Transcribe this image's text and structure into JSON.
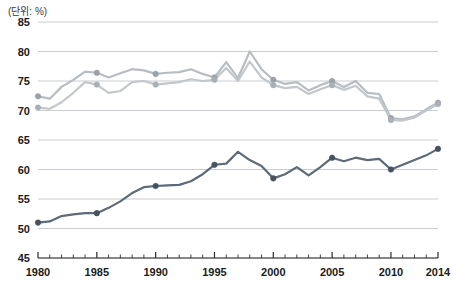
{
  "unit_label": "(단위: %)",
  "chart_data": {
    "type": "line",
    "title": "",
    "subtitle": "",
    "xlabel": "",
    "ylabel": "",
    "unit": "%",
    "grid": true,
    "legend_position": "none",
    "xlim": [
      1980,
      2014
    ],
    "ylim": [
      45,
      85
    ],
    "yticks": [
      45,
      50,
      55,
      60,
      65,
      70,
      75,
      80,
      85
    ],
    "xticks": [
      1980,
      1985,
      1990,
      1995,
      2000,
      2005,
      2010,
      2014
    ],
    "xtick_labels": [
      "1980",
      "1985",
      "1990",
      "1995",
      "2000",
      "2005",
      "2010",
      "2014"
    ],
    "ytick_labels": [
      "45",
      "50",
      "55",
      "60",
      "65",
      "70",
      "75",
      "80",
      "85"
    ],
    "minor_xticks_every": 1,
    "x": [
      1980,
      1981,
      1982,
      1983,
      1984,
      1985,
      1986,
      1987,
      1988,
      1989,
      1990,
      1991,
      1992,
      1993,
      1994,
      1995,
      1996,
      1997,
      1998,
      1999,
      2000,
      2001,
      2002,
      2003,
      2004,
      2005,
      2006,
      2007,
      2008,
      2009,
      2010,
      2011,
      2012,
      2013,
      2014
    ],
    "series": [
      {
        "name": "series-upper-gray",
        "color": "#b7bdc2",
        "marker_color": "#9aa2a8",
        "values": [
          72.4,
          72.0,
          74.0,
          75.2,
          76.6,
          76.4,
          75.6,
          76.3,
          77.0,
          76.8,
          76.2,
          76.4,
          76.5,
          77.0,
          76.2,
          75.6,
          78.2,
          75.5,
          80.0,
          77.0,
          75.2,
          74.5,
          74.8,
          73.4,
          74.3,
          75.0,
          74.0,
          75.0,
          73.0,
          72.8,
          68.7,
          68.5,
          69.0,
          70.2,
          71.3
        ]
      },
      {
        "name": "series-lower-gray",
        "color": "#c2c7cb",
        "marker_color": "#a8b0b5",
        "values": [
          70.5,
          70.3,
          71.4,
          73.0,
          74.8,
          74.4,
          73.0,
          73.3,
          74.8,
          75.0,
          74.4,
          74.6,
          74.8,
          75.3,
          75.0,
          75.2,
          77.2,
          75.0,
          78.3,
          75.6,
          74.3,
          73.8,
          74.0,
          72.8,
          73.6,
          74.3,
          73.5,
          74.2,
          72.4,
          72.0,
          68.4,
          68.3,
          68.8,
          70.0,
          71.1
        ]
      },
      {
        "name": "series-dark",
        "color": "#5b6b7a",
        "marker_color": "#44535f",
        "values": [
          51.0,
          51.2,
          52.1,
          52.4,
          52.6,
          52.6,
          53.5,
          54.6,
          56.0,
          57.0,
          57.2,
          57.3,
          57.4,
          58.0,
          59.2,
          60.8,
          61.0,
          63.0,
          61.6,
          60.6,
          58.5,
          59.2,
          60.4,
          59.0,
          60.4,
          62.0,
          61.4,
          62.0,
          61.6,
          61.8,
          60.0,
          60.8,
          61.6,
          62.4,
          63.5
        ]
      }
    ],
    "marker_years": [
      1980,
      1985,
      1990,
      1995,
      2000,
      2005,
      2010,
      2014
    ],
    "colors": {
      "axis": "#2b2b2b",
      "grid": "#c9ccd0",
      "background": "#ffffff",
      "text": "#1b1b1b"
    }
  }
}
